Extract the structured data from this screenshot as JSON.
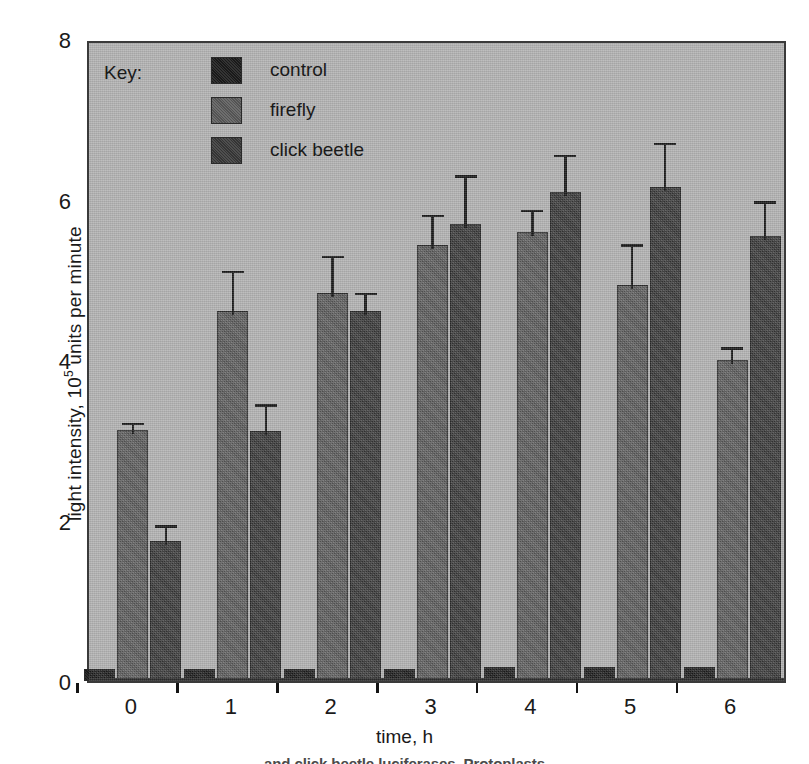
{
  "chart_data": {
    "type": "bar",
    "title": "",
    "xlabel": "time, h",
    "ylabel": "light intensity, 10^5 units per minute",
    "ylabel_prefix": "light intensity, 10",
    "ylabel_exponent": "5",
    "ylabel_suffix": " units per minute",
    "categories": [
      "0",
      "1",
      "2",
      "3",
      "4",
      "5",
      "6"
    ],
    "ylim": [
      0,
      8
    ],
    "yticks": [
      0,
      2,
      4,
      6,
      8
    ],
    "ytick_labels": [
      "0",
      "2",
      "4",
      "6",
      "8"
    ],
    "grid": false,
    "legend_position": "inside-top-left",
    "legend_title": "Key:",
    "series": [
      {
        "name": "control",
        "color": "#1d1d1d",
        "values": [
          0.15,
          0.15,
          0.15,
          0.15,
          0.18,
          0.18,
          0.17
        ],
        "errors": [
          0,
          0,
          0,
          0,
          0,
          0,
          0
        ]
      },
      {
        "name": "firefly",
        "color": "#5e5e5e",
        "values": [
          3.13,
          4.61,
          4.83,
          5.43,
          5.59,
          4.93,
          4.0
        ],
        "errors": [
          0.14,
          0.55,
          0.52,
          0.43,
          0.33,
          0.56,
          0.21
        ]
      },
      {
        "name": "click beetle",
        "color": "#3b3b3b",
        "values": [
          1.74,
          3.11,
          4.61,
          5.7,
          6.09,
          6.16,
          5.55
        ],
        "errors": [
          0.25,
          0.39,
          0.28,
          0.65,
          0.52,
          0.6,
          0.48
        ]
      }
    ]
  },
  "axis": {
    "y_title_prefix": "light intensity, 10",
    "y_title_exponent": "5",
    "y_title_suffix": " units per minute",
    "x_title": "time, h"
  },
  "legend": {
    "title": "Key:",
    "items": [
      {
        "label": "control",
        "swatch": "control"
      },
      {
        "label": "firefly",
        "swatch": "firefly"
      },
      {
        "label": "click beetle",
        "swatch": "clickbeetle"
      }
    ]
  },
  "caption": {
    "text": "and click beetle luciferases. Protoplasts"
  },
  "colors": {
    "plot_background": "#b2b2b2",
    "page_background": "#ffffff",
    "axis": "#141414",
    "control": "#1d1d1d",
    "firefly": "#5e5e5e",
    "click_beetle": "#3b3b3b"
  }
}
